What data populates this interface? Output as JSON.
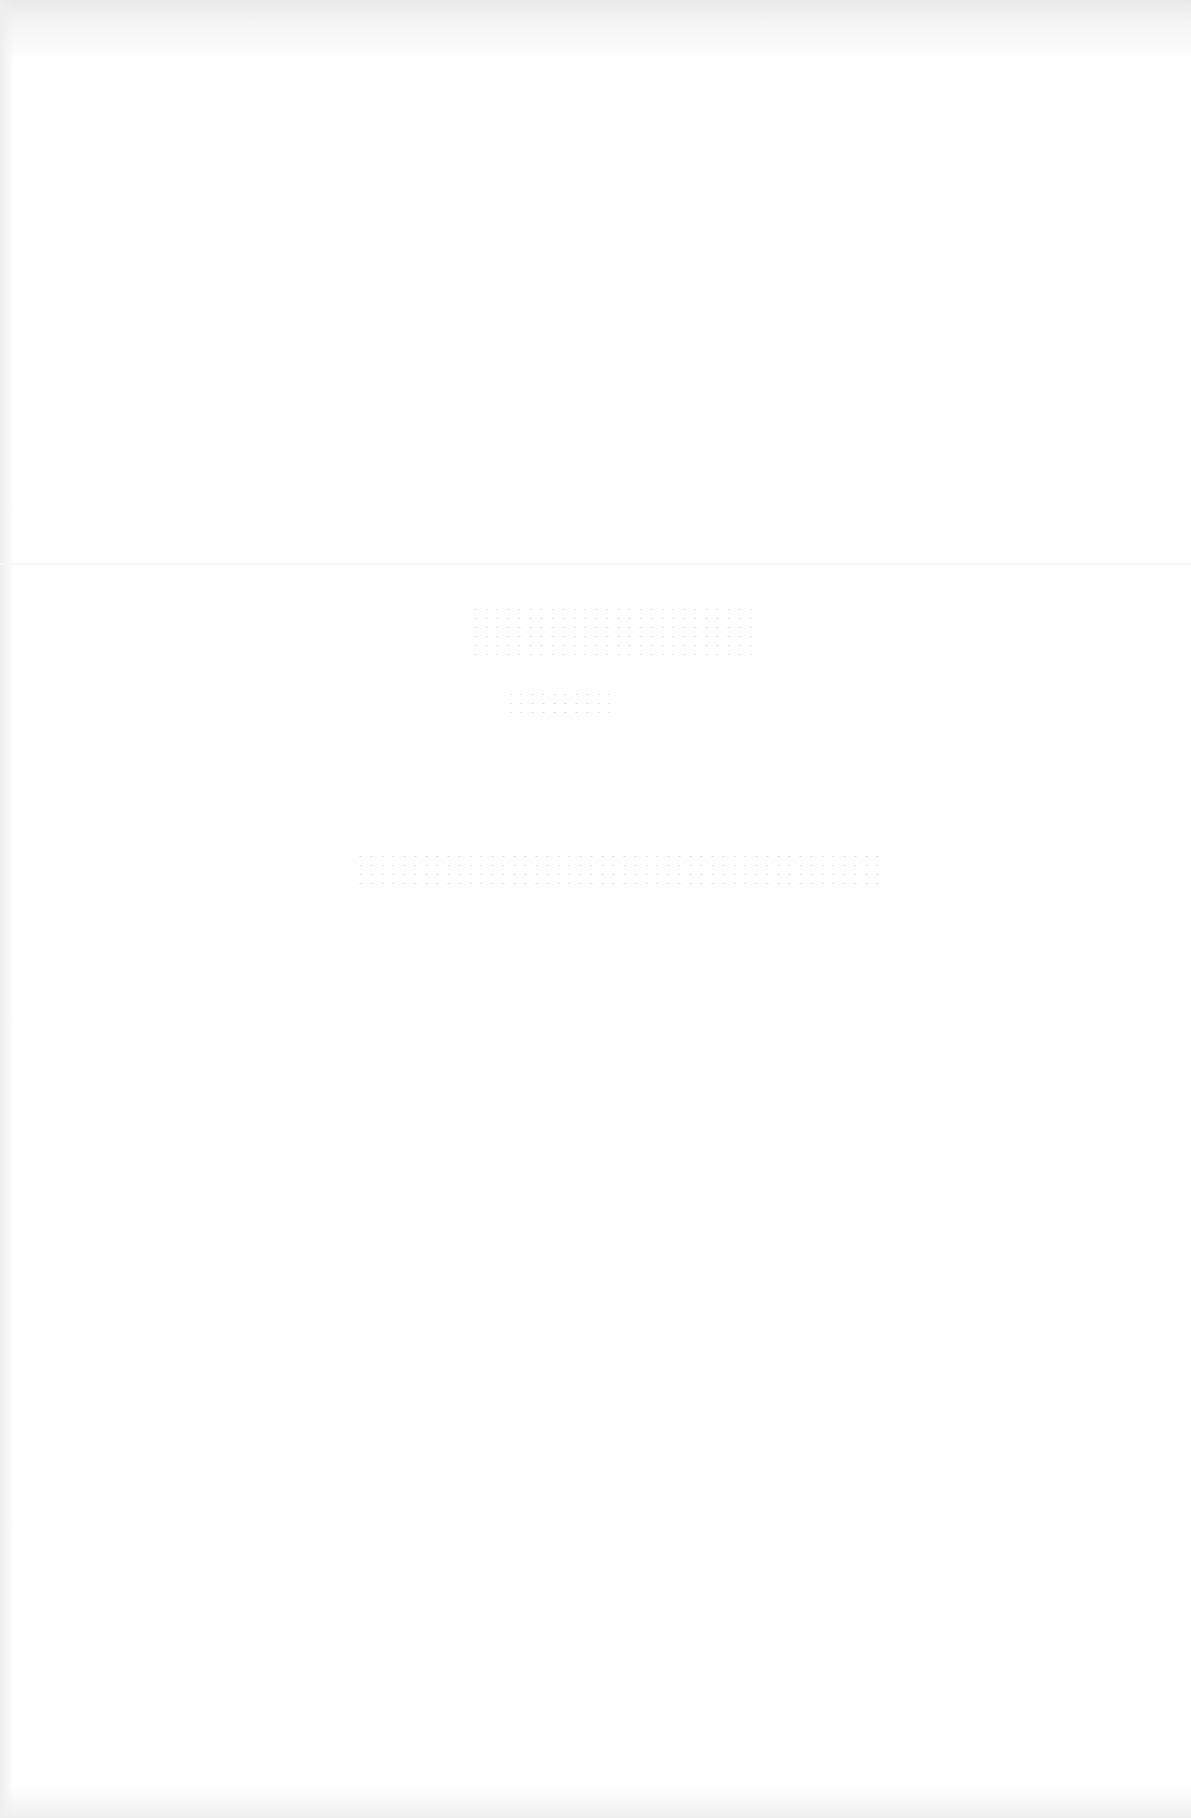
{
  "document": {
    "type": "scanned-page",
    "background_color": "#fefefe",
    "edge_shade_color": "#e9e9e9",
    "ghost_text_color": "#d8d8d8",
    "content": {
      "title": "",
      "subtitle": "",
      "body_line": ""
    },
    "legibility": "faint bleed-through; no readable text"
  }
}
